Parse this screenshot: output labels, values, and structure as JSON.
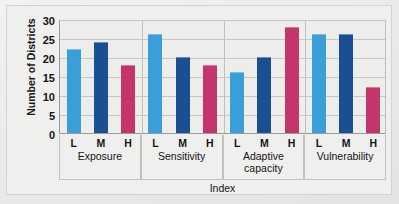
{
  "chart_data": {
    "type": "bar",
    "title": "",
    "xlabel": "Index",
    "ylabel": "Number of Districts",
    "ylim": [
      0,
      30
    ],
    "yticks": [
      0,
      5,
      10,
      15,
      20,
      25,
      30
    ],
    "grid": true,
    "legend": "none",
    "categories": [
      "Exposure",
      "Sensitivity",
      "Adaptive capacity",
      "Vulnerability"
    ],
    "levels": [
      "L",
      "M",
      "H"
    ],
    "series": [
      {
        "name": "L",
        "color": "#3a9fd8",
        "values": [
          22,
          26,
          16,
          26
        ]
      },
      {
        "name": "M",
        "color": "#1b4f94",
        "values": [
          24,
          20,
          20,
          26
        ]
      },
      {
        "name": "H",
        "color": "#c4356b",
        "values": [
          18,
          18,
          28,
          12
        ]
      }
    ],
    "groups": [
      {
        "label": "Exposure",
        "bars": [
          {
            "level": "L",
            "value": 22
          },
          {
            "level": "M",
            "value": 24
          },
          {
            "level": "H",
            "value": 18
          }
        ]
      },
      {
        "label": "Sensitivity",
        "bars": [
          {
            "level": "L",
            "value": 26
          },
          {
            "level": "M",
            "value": 20
          },
          {
            "level": "H",
            "value": 18
          }
        ]
      },
      {
        "label": "Adaptive capacity",
        "bars": [
          {
            "level": "L",
            "value": 16
          },
          {
            "level": "M",
            "value": 20
          },
          {
            "level": "H",
            "value": 28
          }
        ]
      },
      {
        "label": "Vulnerability",
        "bars": [
          {
            "level": "L",
            "value": 26
          },
          {
            "level": "M",
            "value": 26
          },
          {
            "level": "H",
            "value": 12
          }
        ]
      }
    ],
    "colors": {
      "low": "#3a9fd8",
      "medium": "#1b4f94",
      "high": "#c4356b",
      "plot_background": "#ededeb",
      "figure_background": "#efefed",
      "gridline": "#c6c6c4",
      "axis": "#9a9a98",
      "text": "#141414"
    }
  }
}
